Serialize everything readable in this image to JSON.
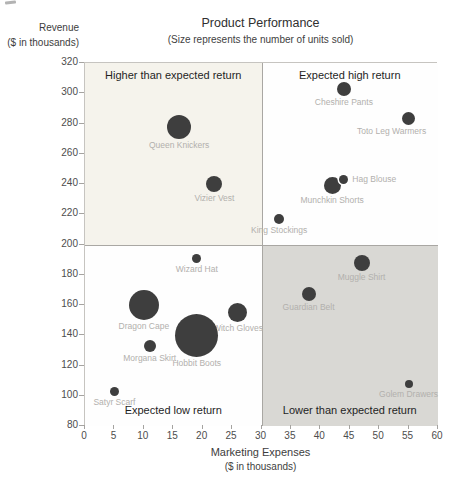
{
  "chart": {
    "title": "Product Performance",
    "subtitle": "(Size represents the number of units sold)",
    "y_axis_title_line1": "Revenue",
    "y_axis_title_line2": "($ in thousands)",
    "x_axis_title_line1": "Marketing Expenses",
    "x_axis_title_line2": "($ in thousands)"
  },
  "chart_data": {
    "type": "scatter",
    "variant": "bubble-quadrant",
    "title": "Product Performance",
    "subtitle": "(Size represents the number of units sold)",
    "xlabel": "Marketing Expenses ($ in thousands)",
    "ylabel": "Revenue ($ in thousands)",
    "xlim": [
      0,
      60
    ],
    "ylim": [
      80,
      320
    ],
    "xtick_step": 5,
    "ytick_step": 20,
    "grid": false,
    "legend": "none",
    "size_note": "Bubble size represents the number of units sold (no numeric values shown); r_px is the rendered bubble radius in pixels",
    "quadrant_split": {
      "x": 30,
      "y": 200
    },
    "quadrants": [
      {
        "name": "top-left",
        "label": "Higher than expected return",
        "bg": "#f5f3ec",
        "label_vpos": "top"
      },
      {
        "name": "top-right",
        "label": "Expected high return",
        "bg": "#fefefe",
        "label_vpos": "top"
      },
      {
        "name": "bottom-left",
        "label": "Expected low return",
        "bg": "#fefefe",
        "label_vpos": "bottom"
      },
      {
        "name": "bottom-right",
        "label": "Lower than expected return",
        "bg": "#d9d8d4",
        "label_vpos": "bottom"
      }
    ],
    "bubble_color": "#3e3e3e",
    "point_label_color": "#b2b0ad",
    "points": [
      {
        "label": "Queen Knickers",
        "x": 16,
        "y": 278,
        "r_px": 12,
        "label_pos": "below"
      },
      {
        "label": "Cheshire Pants",
        "x": 44,
        "y": 303,
        "r_px": 7,
        "label_pos": "below"
      },
      {
        "label": "Toto Leg Warmers",
        "x": 55,
        "y": 283,
        "r_px": 6.5,
        "label_pos": "below",
        "label_dx": -17
      },
      {
        "label": "Vizier Vest",
        "x": 22,
        "y": 240,
        "r_px": 8,
        "label_pos": "below"
      },
      {
        "label": "Munchkin Shorts",
        "x": 42,
        "y": 239,
        "r_px": 8.5,
        "label_pos": "below"
      },
      {
        "label": "Hag Blouse",
        "x": 44,
        "y": 243,
        "r_px": 4.5,
        "label_pos": "right",
        "ring": true
      },
      {
        "label": "King Stockings",
        "x": 33,
        "y": 217,
        "r_px": 5,
        "label_pos": "below"
      },
      {
        "label": "Wizard Hat",
        "x": 19,
        "y": 191,
        "r_px": 4.5,
        "label_pos": "below"
      },
      {
        "label": "Muggle Shirt",
        "x": 47,
        "y": 188,
        "r_px": 8,
        "label_pos": "below"
      },
      {
        "label": "Guardian Belt",
        "x": 38,
        "y": 167,
        "r_px": 7,
        "label_pos": "below"
      },
      {
        "label": "Dragon Cape",
        "x": 10,
        "y": 160,
        "r_px": 15,
        "label_pos": "below"
      },
      {
        "label": "Witch Gloves",
        "x": 26,
        "y": 155,
        "r_px": 9.5,
        "label_pos": "below"
      },
      {
        "label": "Morgana Skirt",
        "x": 11,
        "y": 133,
        "r_px": 6,
        "label_pos": "below"
      },
      {
        "label": "Hobbit Boots",
        "x": 19,
        "y": 140,
        "r_px": 21.5,
        "label_pos": "below"
      },
      {
        "label": "Satyr Scarf",
        "x": 5,
        "y": 103,
        "r_px": 4.5,
        "label_pos": "below"
      },
      {
        "label": "Golem Drawers",
        "x": 55,
        "y": 108,
        "r_px": 4,
        "label_pos": "below"
      }
    ]
  }
}
